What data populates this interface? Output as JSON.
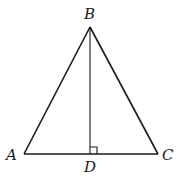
{
  "diagram": {
    "type": "geometry",
    "shape": "triangle",
    "points": {
      "A": {
        "label": "A",
        "x": 24,
        "y": 154
      },
      "B": {
        "label": "B",
        "x": 90,
        "y": 27
      },
      "C": {
        "label": "C",
        "x": 158,
        "y": 154
      },
      "D": {
        "label": "D",
        "x": 90,
        "y": 154
      }
    },
    "segments": [
      "AB",
      "BC",
      "AC",
      "BD"
    ],
    "right_angle_at": "D",
    "colors": {
      "stroke": "#1a1a1a",
      "background": "#ffffff"
    }
  }
}
